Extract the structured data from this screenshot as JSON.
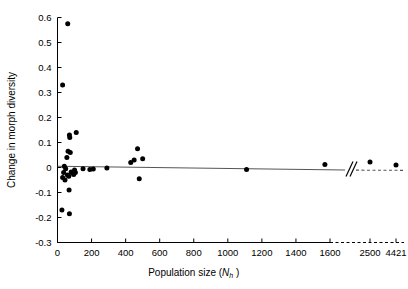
{
  "chart_data": {
    "type": "scatter",
    "title": "",
    "xlabel": "Population size (N_h)",
    "xlabel_main": "Population size (",
    "xlabel_italic": "N",
    "xlabel_subscript": "h",
    "xlabel_close": " )",
    "ylabel": "Change in morph diversity",
    "xlim": [
      0,
      1700
    ],
    "ylim": [
      -0.3,
      0.6
    ],
    "grid": false,
    "legend": null,
    "axis_break": {
      "present": true,
      "marker": "double-slash",
      "after_value": 1600,
      "style": "dashed",
      "extra_ticks": [
        2500,
        4421
      ]
    },
    "xticks": [
      0,
      200,
      400,
      600,
      800,
      1000,
      1200,
      1400,
      1600
    ],
    "xticklabels": [
      "0",
      "200",
      "400",
      "600",
      "800",
      "1000",
      "1200",
      "1400",
      "1600"
    ],
    "xticks_broken": [
      2500,
      4421
    ],
    "xticklabels_broken": [
      "2500",
      "4421"
    ],
    "yticks": [
      0.6,
      0.5,
      0.4,
      0.3,
      0.2,
      0.1,
      0,
      -0.1,
      -0.2,
      -0.3
    ],
    "yticklabels": [
      "0.6",
      "0.5",
      "0.4",
      "0.3",
      "0.2",
      "0.1",
      "0",
      "-0.1",
      "-0.2",
      "-0.3"
    ],
    "marker_color": "#000000",
    "line_color": "#555555",
    "points": [
      {
        "x": 60,
        "y": 0.575
      },
      {
        "x": 30,
        "y": 0.33
      },
      {
        "x": 70,
        "y": 0.13
      },
      {
        "x": 72,
        "y": 0.12
      },
      {
        "x": 110,
        "y": 0.14
      },
      {
        "x": 62,
        "y": 0.065
      },
      {
        "x": 75,
        "y": 0.06
      },
      {
        "x": 55,
        "y": 0.04
      },
      {
        "x": 40,
        "y": 0.005
      },
      {
        "x": 48,
        "y": -0.005
      },
      {
        "x": 36,
        "y": -0.02
      },
      {
        "x": 30,
        "y": -0.04
      },
      {
        "x": 44,
        "y": -0.05
      },
      {
        "x": 58,
        "y": -0.03
      },
      {
        "x": 66,
        "y": -0.035
      },
      {
        "x": 80,
        "y": -0.018
      },
      {
        "x": 88,
        "y": -0.022
      },
      {
        "x": 95,
        "y": -0.028
      },
      {
        "x": 100,
        "y": -0.01
      },
      {
        "x": 105,
        "y": -0.02
      },
      {
        "x": 68,
        "y": -0.09
      },
      {
        "x": 26,
        "y": -0.17
      },
      {
        "x": 70,
        "y": -0.185
      },
      {
        "x": 150,
        "y": -0.005
      },
      {
        "x": 190,
        "y": -0.008
      },
      {
        "x": 210,
        "y": -0.006
      },
      {
        "x": 290,
        "y": -0.002
      },
      {
        "x": 430,
        "y": 0.02
      },
      {
        "x": 450,
        "y": 0.03
      },
      {
        "x": 470,
        "y": 0.075
      },
      {
        "x": 500,
        "y": 0.035
      },
      {
        "x": 480,
        "y": -0.045
      },
      {
        "x": 1110,
        "y": -0.008
      },
      {
        "x": 1570,
        "y": 0.012
      },
      {
        "x": 2500,
        "y": 0.022
      },
      {
        "x": 4421,
        "y": 0.01
      }
    ],
    "regression_line": {
      "x_start": 0,
      "y_start": 0.005,
      "x_end": 1700,
      "y_end": -0.009
    }
  }
}
